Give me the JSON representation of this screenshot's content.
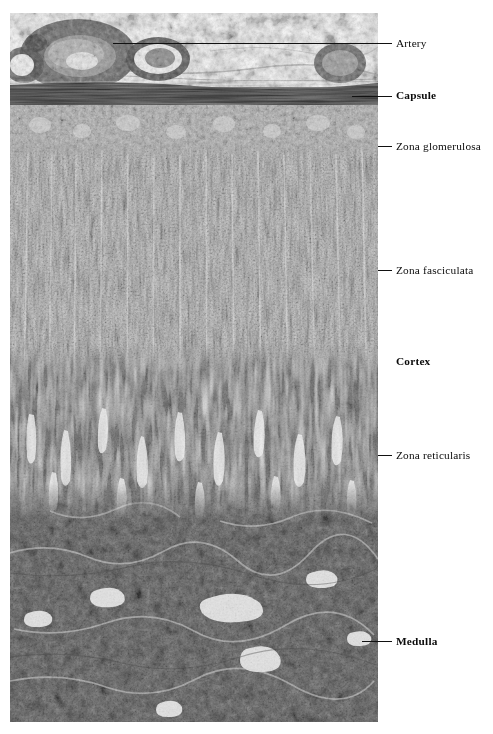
{
  "figure": {
    "type": "histology-micrograph",
    "stain_tone": "grayscale",
    "image_bounds": {
      "x": 10,
      "y": 13,
      "width": 368,
      "height": 709
    }
  },
  "labels": [
    {
      "id": "artery",
      "text": "Artery",
      "bold": false,
      "x": 396,
      "y": 38,
      "leader": {
        "x": 113,
        "y": 43,
        "width": 279
      }
    },
    {
      "id": "capsule",
      "text": "Capsule",
      "bold": true,
      "x": 396,
      "y": 90,
      "leader": {
        "x": 352,
        "y": 96,
        "width": 40
      }
    },
    {
      "id": "zona-glomerulosa",
      "text": "Zona glomerulosa",
      "bold": false,
      "x": 396,
      "y": 141,
      "leader": {
        "x": 378,
        "y": 146,
        "width": 14
      }
    },
    {
      "id": "zona-fasciculata",
      "text": "Zona fasciculata",
      "bold": false,
      "x": 396,
      "y": 265,
      "leader": {
        "x": 378,
        "y": 270,
        "width": 14
      }
    },
    {
      "id": "cortex",
      "text": "Cortex",
      "bold": true,
      "x": 396,
      "y": 356,
      "leader": null
    },
    {
      "id": "zona-reticularis",
      "text": "Zona reticularis",
      "bold": false,
      "x": 396,
      "y": 450,
      "leader": {
        "x": 378,
        "y": 455,
        "width": 14
      }
    },
    {
      "id": "medulla",
      "text": "Medulla",
      "bold": true,
      "x": 396,
      "y": 636,
      "leader": {
        "x": 362,
        "y": 641,
        "width": 30
      }
    }
  ],
  "zones": [
    {
      "id": "perirenal-fat",
      "label": "Periadrenal connective tissue and fat",
      "y0": 0,
      "y1": 72,
      "tone": "#f2f2f2"
    },
    {
      "id": "capsule-band",
      "label": "Capsule",
      "y0": 72,
      "y1": 92,
      "tone": "#4a4a4a"
    },
    {
      "id": "zona-glomerulosa",
      "label": "Zona glomerulosa",
      "y0": 92,
      "y1": 140,
      "tone": "#b4b4b4"
    },
    {
      "id": "zona-fasciculata",
      "label": "Zona fasciculata",
      "y0": 140,
      "y1": 370,
      "tone": "#c8c8c8"
    },
    {
      "id": "zona-reticularis",
      "label": "Zona reticularis",
      "y0": 370,
      "y1": 520,
      "tone": "#8e8e8e"
    },
    {
      "id": "medulla",
      "label": "Medulla",
      "y0": 520,
      "y1": 709,
      "tone": "#7d7d7d"
    }
  ],
  "colors": {
    "background": "#ffffff",
    "label_text": "#0b0b0b",
    "leader_line": "#111111",
    "tissue_light": "#d8d8d8",
    "tissue_mid": "#a8a8a8",
    "tissue_dark": "#5a5a5a"
  }
}
